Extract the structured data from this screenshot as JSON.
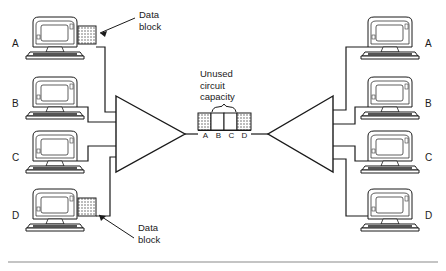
{
  "diagram": {
    "colors": {
      "line": "#1a1a1a",
      "fill_block": "#d8d8d8",
      "empty_block": "#ffffff",
      "text": "#1a1a1a",
      "rule": "#8a8a8a"
    }
  },
  "left_terminals": [
    {
      "label": "A",
      "has_data_block": true
    },
    {
      "label": "B",
      "has_data_block": false
    },
    {
      "label": "C",
      "has_data_block": false
    },
    {
      "label": "D",
      "has_data_block": true
    }
  ],
  "right_terminals": [
    {
      "label": "A"
    },
    {
      "label": "B"
    },
    {
      "label": "C"
    },
    {
      "label": "D"
    }
  ],
  "callouts": [
    {
      "id": "top",
      "line1": "Data",
      "line2": "block"
    },
    {
      "id": "bottom",
      "line1": "Data",
      "line2": "block"
    }
  ],
  "capacity": {
    "line1": "Unused",
    "line2": "circuit",
    "line3": "capacity"
  },
  "circuit_slots": [
    {
      "label": "A",
      "filled": true
    },
    {
      "label": "B",
      "filled": false
    },
    {
      "label": "C",
      "filled": false
    },
    {
      "label": "D",
      "filled": true
    }
  ]
}
